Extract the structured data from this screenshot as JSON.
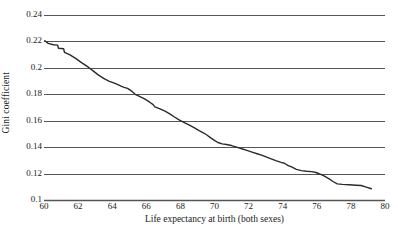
{
  "chart_data": {
    "type": "line",
    "title": "",
    "xlabel": "Life expectancy at birth (both sexes)",
    "ylabel": "Gini coefficient",
    "xlim": [
      60,
      80
    ],
    "ylim": [
      0.1,
      0.24
    ],
    "xticks": [
      60,
      62,
      64,
      66,
      68,
      70,
      72,
      74,
      76,
      78,
      80
    ],
    "xtick_labels": [
      "60",
      "62",
      "64",
      "66",
      "68",
      "70",
      "72",
      "74",
      "76",
      "78",
      "80"
    ],
    "yticks": [
      0.1,
      0.12,
      0.14,
      0.16,
      0.18,
      0.2,
      0.22,
      0.24
    ],
    "ytick_labels": [
      "0.1",
      "0.12",
      "0.14",
      "0.16",
      "0.18",
      "0.2",
      "0.22",
      "0.24"
    ],
    "grid": "horizontal",
    "grid_color": "#555555",
    "legend": "none",
    "line_color": "#2b2b2b",
    "line_width": 1.4,
    "series": [
      {
        "name": "Gini coefficient by life expectancy",
        "x": [
          60.05,
          60.25,
          60.55,
          60.8,
          60.85,
          61.15,
          61.2,
          61.5,
          61.9,
          62.2,
          62.6,
          62.9,
          63.2,
          63.5,
          63.8,
          64.05,
          64.3,
          64.55,
          64.7,
          64.9,
          65.1,
          65.35,
          65.6,
          65.9,
          66.2,
          66.4,
          66.5,
          66.8,
          67.1,
          67.4,
          67.65,
          67.9,
          68.2,
          68.5,
          68.8,
          69.1,
          69.4,
          69.55,
          69.7,
          69.95,
          70.2,
          70.45,
          70.7,
          71.0,
          71.3,
          71.6,
          71.9,
          72.2,
          72.5,
          72.8,
          73.1,
          73.4,
          73.6,
          73.9,
          74.1,
          74.3,
          74.55,
          74.8,
          75.1,
          75.4,
          75.7,
          75.95,
          76.2,
          76.45,
          76.7,
          76.95,
          77.2,
          77.5,
          77.9,
          78.3,
          78.6,
          78.9,
          79.2
        ],
        "y": [
          0.2205,
          0.2185,
          0.2175,
          0.2172,
          0.2148,
          0.2145,
          0.2118,
          0.21,
          0.2068,
          0.204,
          0.2005,
          0.1975,
          0.1945,
          0.192,
          0.19,
          0.1888,
          0.1875,
          0.186,
          0.1852,
          0.1845,
          0.1828,
          0.18,
          0.1785,
          0.1765,
          0.174,
          0.1722,
          0.1705,
          0.169,
          0.1672,
          0.165,
          0.1628,
          0.1608,
          0.1588,
          0.1568,
          0.1548,
          0.1525,
          0.1505,
          0.1492,
          0.1478,
          0.1455,
          0.1435,
          0.1425,
          0.142,
          0.1412,
          0.14,
          0.1388,
          0.1375,
          0.1362,
          0.135,
          0.1338,
          0.1322,
          0.1308,
          0.1298,
          0.1285,
          0.1278,
          0.1262,
          0.1248,
          0.1232,
          0.1222,
          0.1218,
          0.1215,
          0.1208,
          0.1195,
          0.118,
          0.1162,
          0.114,
          0.1122,
          0.1118,
          0.1115,
          0.1112,
          0.111,
          0.1098,
          0.1085
        ]
      }
    ]
  }
}
